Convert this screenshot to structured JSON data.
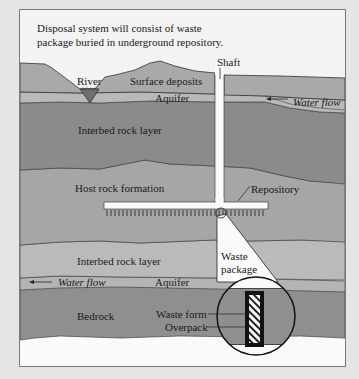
{
  "figure": {
    "caption_line1": "Disposal system will consist of waste",
    "caption_line2": "package buried in underground repository.",
    "labels": {
      "shaft": "Shaft",
      "river": "River",
      "surface_deposits": "Surface deposits",
      "aquifer_upper": "Aquifer",
      "water_flow_upper": "Water flow",
      "interbed_upper": "Interbed rock layer",
      "host_rock": "Host rock formation",
      "repository": "Repository",
      "interbed_lower": "Interbed rock layer",
      "waste_package_1": "Waste",
      "waste_package_2": "package",
      "water_flow_lower": "Water flow",
      "aquifer_lower": "Aquifer",
      "bedrock": "Bedrock",
      "waste_form": "Waste form",
      "overpack": "Overpack"
    },
    "colors": {
      "page_bg": "#e5e5e5",
      "frame_bg": "#f3f3f3",
      "surface": "#a9a9a9",
      "aquifer": "#b9b9b9",
      "interbed_dark": "#8b8b8b",
      "host_rock": "#a6a6a6",
      "interbed_light": "#bababa",
      "bedrock": "#8f8f8f",
      "river": "#6e6e6e",
      "white": "#fafafa",
      "ink": "#1a1a1a"
    }
  }
}
